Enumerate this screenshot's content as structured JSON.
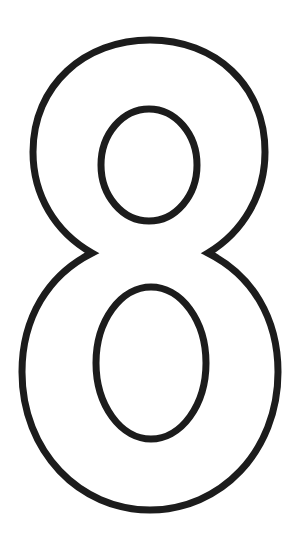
{
  "figure": {
    "glyph": "8",
    "style": "outline",
    "stroke_color": "#1c1c1c",
    "fill_color": "#ffffff",
    "background": "#ffffff"
  }
}
